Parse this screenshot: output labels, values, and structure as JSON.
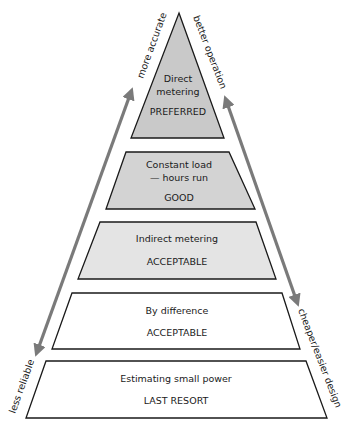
{
  "diagram": {
    "type": "pyramid",
    "tiers": [
      {
        "line1": "Direct",
        "line2": "metering",
        "rating": "PREFERRED",
        "fill": "#c9c9c9"
      },
      {
        "line1": "Constant load",
        "line2": "— hours run",
        "rating": "GOOD",
        "fill": "#d3d3d3"
      },
      {
        "line1": "Indirect metering",
        "rating": "ACCEPTABLE",
        "fill": "#e4e4e4"
      },
      {
        "line1": "By difference",
        "rating": "ACCEPTABLE",
        "fill": "#ffffff"
      },
      {
        "line1": "Estimating small power",
        "rating": "LAST RESORT",
        "fill": "#ffffff"
      }
    ],
    "left_axis": {
      "top_label": "more accurate",
      "bottom_label": "less reliable"
    },
    "right_axis": {
      "top_label": "better operation",
      "bottom_label": "cheaper/easier design"
    },
    "arrow_color": "#7a7a7a"
  }
}
